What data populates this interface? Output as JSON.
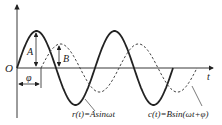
{
  "diagram": {
    "axis_labels": {
      "origin": "O",
      "x": "t"
    },
    "amplitude_labels": {
      "input": "A",
      "output": "B"
    },
    "phase_label": "φ",
    "curves": [
      {
        "name": "input",
        "label": "r(t)=Asinωt",
        "style": "solid",
        "amplitude_name": "A",
        "cycles": 2
      },
      {
        "name": "output",
        "label": "c(t)=Bsin(ωt+φ)",
        "style": "dashed",
        "amplitude_name": "B",
        "cycles": 2
      }
    ],
    "amplitude_ratio_B_over_A": 0.65,
    "colors": {
      "stroke": "#222222"
    }
  }
}
